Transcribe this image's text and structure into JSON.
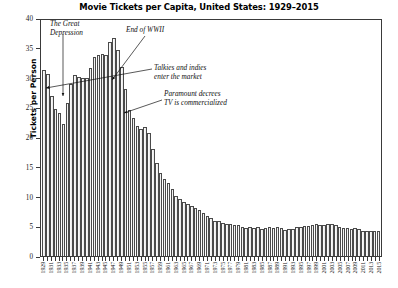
{
  "chart_data": {
    "type": "bar",
    "title": "Movie Tickets per Capita, United States: 1929–2015",
    "xlabel": "",
    "ylabel": "Tickets per Person",
    "ylim": [
      0,
      40
    ],
    "yticks": [
      0,
      5,
      10,
      15,
      20,
      25,
      30,
      35,
      40
    ],
    "grid": false,
    "legend": null,
    "categories": [
      "1929",
      "1930",
      "1931",
      "1932",
      "1933",
      "1934",
      "1935",
      "1936",
      "1937",
      "1938",
      "1939",
      "1940",
      "1941",
      "1942",
      "1943",
      "1944",
      "1945",
      "1946",
      "1947",
      "1948",
      "1949",
      "1950",
      "1951",
      "1952",
      "1953",
      "1954",
      "1955",
      "1956",
      "1957",
      "1958",
      "1959",
      "1960",
      "1961",
      "1962",
      "1963",
      "1964",
      "1965",
      "1966",
      "1967",
      "1968",
      "1969",
      "1970",
      "1971",
      "1972",
      "1973",
      "1974",
      "1975",
      "1976",
      "1977",
      "1978",
      "1979",
      "1980",
      "1981",
      "1982",
      "1983",
      "1984",
      "1985",
      "1986",
      "1987",
      "1988",
      "1989",
      "1990",
      "1991",
      "1992",
      "1993",
      "1994",
      "1995",
      "1996",
      "1997",
      "1998",
      "1999",
      "2000",
      "2001",
      "2002",
      "2003",
      "2004",
      "2005",
      "2006",
      "2007",
      "2008",
      "2009",
      "2010",
      "2011",
      "2012",
      "2013",
      "2014",
      "2015"
    ],
    "tick_label_years": [
      "1929",
      "1931",
      "1933",
      "1935",
      "1937",
      "1939",
      "1941",
      "1943",
      "1945",
      "1947",
      "1949",
      "1951",
      "1953",
      "1955",
      "1957",
      "1959",
      "1961",
      "1963",
      "1965",
      "1967",
      "1969",
      "1971",
      "1973",
      "1975",
      "1977",
      "1979",
      "1981",
      "1983",
      "1985",
      "1987",
      "1989",
      "1991",
      "1993",
      "1995",
      "1997",
      "1999",
      "2001",
      "2003",
      "2005",
      "2007",
      "2009",
      "2011",
      "2013",
      "2015"
    ],
    "values": [
      31.5,
      30.9,
      27.2,
      25.0,
      24.3,
      22.4,
      26.0,
      29.2,
      30.6,
      30.4,
      30.2,
      30.1,
      31.8,
      33.8,
      34.0,
      34.2,
      34.1,
      36.3,
      36.9,
      35.0,
      32.0,
      28.3,
      24.8,
      23.4,
      22.1,
      21.6,
      21.8,
      20.9,
      18.2,
      15.8,
      14.1,
      13.1,
      12.4,
      11.3,
      10.2,
      9.6,
      9.2,
      8.8,
      8.4,
      8.1,
      7.8,
      7.3,
      6.8,
      6.4,
      6.0,
      5.9,
      5.6,
      5.5,
      5.4,
      5.3,
      5.3,
      4.9,
      4.7,
      4.9,
      4.8,
      4.9,
      4.6,
      4.7,
      4.9,
      4.8,
      5.0,
      4.7,
      4.4,
      4.5,
      4.6,
      4.9,
      5.0,
      5.1,
      5.1,
      5.3,
      5.4,
      5.3,
      5.2,
      5.5,
      5.4,
      5.2,
      4.9,
      4.8,
      4.8,
      4.6,
      4.7,
      4.5,
      4.3,
      4.3,
      4.2,
      4.2,
      4.2
    ],
    "annotations": [
      {
        "id": "depression",
        "text": "The Great\nDepression",
        "target_year": "1934",
        "target_value": 22.4
      },
      {
        "id": "wwii",
        "text": "End of WWII",
        "target_year": "1945",
        "target_value": 34.1
      },
      {
        "id": "talkies",
        "text": "Talkies and indies\nenter the market",
        "target_year": "1929",
        "target_value": 29.0
      },
      {
        "id": "paramount",
        "text": "Paramount decrees\nTV is commercialized",
        "target_year": "1949",
        "target_value": 22.3
      }
    ],
    "colors": {
      "bar_fill": "#f2f2f2",
      "bar_edge": "#4a4a4a",
      "axis": "#3a3a3a",
      "text": "#111111",
      "background": "#ffffff"
    }
  }
}
